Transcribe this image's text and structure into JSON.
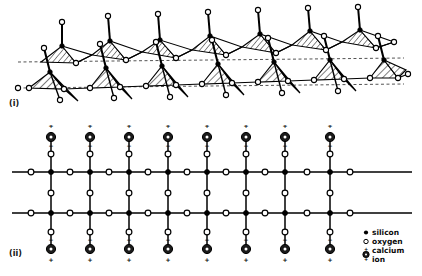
{
  "figure": {
    "panels": [
      {
        "id": "i",
        "label": "(i)",
        "description": "Perspective view of a double chain of linked SiO4 tetrahedra with shaded/hatched faces"
      },
      {
        "id": "ii",
        "label": "(ii)",
        "description": "Schematic projection showing silicon, oxygen and calcium ion positions"
      }
    ]
  },
  "legend": {
    "items": [
      {
        "symbol": "filled-dot",
        "label": "silicon"
      },
      {
        "symbol": "open-circle",
        "label": "oxygen"
      },
      {
        "symbol": "calcium-ion-circle",
        "label": "calcium",
        "label2": "ion"
      }
    ]
  },
  "colors": {
    "ink": "#000000",
    "background": "#ffffff",
    "hatch": "#111111",
    "calcium_fill": "#1a1a1a"
  },
  "schematic": {
    "columns": 8,
    "column_spacing": 39.2,
    "first_column_x": 51,
    "chain_rows_y": [
      172,
      213
    ],
    "calcium_top_y": 137,
    "calcium_bottom_y": 249,
    "bridging_oxygen_top_y": 154,
    "bridging_oxygen_bottom_y": 232,
    "charge_top": "+",
    "charge_bottom": "+",
    "charge_inner": "-"
  },
  "tetrahedra": {
    "units": 8,
    "unit_spacing": 39.2,
    "apex_oxygen_label": "O",
    "chain_baseline_y": 88
  }
}
